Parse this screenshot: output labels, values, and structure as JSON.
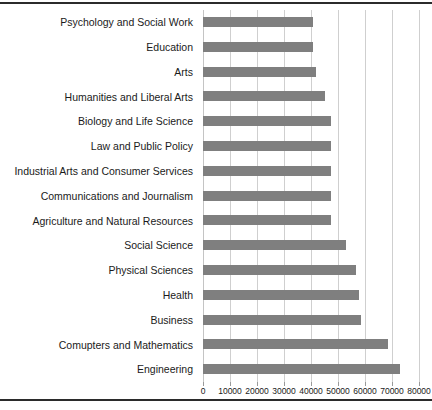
{
  "chart_data": {
    "type": "bar",
    "orientation": "horizontal",
    "title": "",
    "subtitle": "",
    "xlabel": "",
    "ylabel": "",
    "xlim": [
      0,
      80000
    ],
    "ylim": null,
    "grid": "vertical",
    "legend": null,
    "bar_color": "#7f7f7f",
    "xticks": [
      {
        "value": 0,
        "label": "0"
      },
      {
        "value": 10000,
        "label": "10000"
      },
      {
        "value": 20000,
        "label": "20000"
      },
      {
        "value": 30000,
        "label": "30000"
      },
      {
        "value": 40000,
        "label": "40000"
      },
      {
        "value": 50000,
        "label": "50000"
      },
      {
        "value": 60000,
        "label": "60000"
      },
      {
        "value": 70000,
        "label": "70000"
      },
      {
        "value": 80000,
        "label": "80000"
      }
    ],
    "categories": [
      "Psychology and Social Work",
      "Education",
      "Arts",
      "Humanities and Liberal Arts",
      "Biology and Life Science",
      "Law and Public Policy",
      "Industrial Arts and Consumer Services",
      "Communications and Journalism",
      "Agriculture and Natural Resources",
      "Social Science",
      "Physical Sciences",
      "Health",
      "Business",
      "Comupters and Mathematics",
      "Engineering"
    ],
    "values": [
      40700,
      40700,
      41900,
      45000,
      47300,
      47300,
      47300,
      47300,
      47300,
      53000,
      56800,
      57800,
      58700,
      68500,
      72800
    ]
  }
}
